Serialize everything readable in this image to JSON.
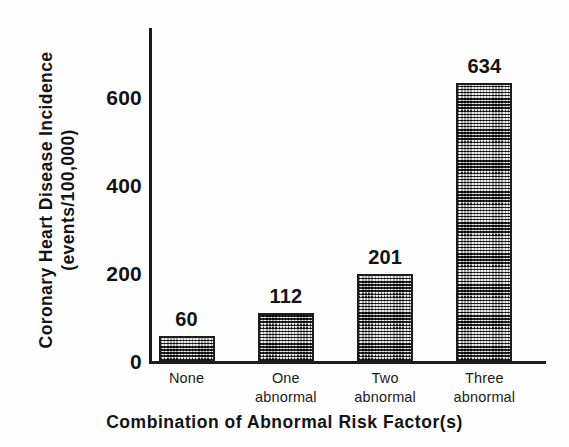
{
  "chart_data": {
    "type": "bar",
    "title": "",
    "xlabel": "Combination of Abnormal Risk Factor(s)",
    "ylabel_line1": "Coronary Heart Disease Incidence",
    "ylabel_line2": "(events/100,000)",
    "categories": [
      "None",
      "One abnormal",
      "Two abnormal",
      "Three abnormal"
    ],
    "category_lines": [
      {
        "l1": "None",
        "l2": ""
      },
      {
        "l1": "One",
        "l2": "abnormal"
      },
      {
        "l1": "Two",
        "l2": "abnormal"
      },
      {
        "l1": "Three",
        "l2": "abnormal"
      }
    ],
    "values": [
      60,
      112,
      201,
      634
    ],
    "value_labels": [
      "60",
      "112",
      "201",
      "634"
    ],
    "yticks": [
      0,
      200,
      400,
      600
    ],
    "ytick_labels": [
      "0",
      "200",
      "400",
      "600"
    ],
    "ylim": [
      0,
      760
    ],
    "grid": false,
    "legend": false,
    "colors": {
      "axis": "#1b1b1b",
      "text": "#131313",
      "bar_fill": "#d9d9d9",
      "bar_edge": "#1d1d1d",
      "background": "#fefefe"
    }
  }
}
